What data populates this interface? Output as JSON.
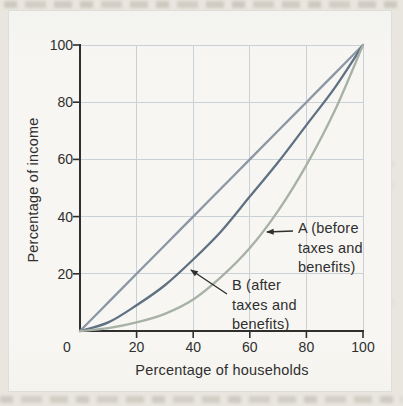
{
  "figure": {
    "y_axis_title": "Percentage of income",
    "x_axis_title": "Percentage of households",
    "label_a": "A (before\ntaxes and\nbenefits)",
    "label_b": "B (after\ntaxes and\nbenefits)"
  },
  "colors": {
    "page_bg": "#e9e6df",
    "figure_bg": "#f7f6f2",
    "grid": "#c9d1d7",
    "axis": "#2f2f2f",
    "text": "#2f2f2f",
    "equality_line": "#8b97a4",
    "curve_b": "#5f7182",
    "curve_a": "#a7b1a5"
  },
  "chart_data": {
    "type": "line",
    "title": "",
    "xlabel": "Percentage of households",
    "ylabel": "Percentage of income",
    "xlim": [
      0,
      100
    ],
    "ylim": [
      0,
      100
    ],
    "x_ticks": [
      0,
      20,
      40,
      60,
      80,
      100
    ],
    "y_ticks": [
      20,
      40,
      60,
      80,
      100
    ],
    "grid": true,
    "legend_position": "annotated-on-plot",
    "x": [
      0,
      10,
      20,
      30,
      40,
      50,
      60,
      70,
      80,
      90,
      100
    ],
    "series": [
      {
        "name": "Line of equality (diagonal)",
        "color": "#8b97a4",
        "values": [
          0,
          10,
          20,
          30,
          40,
          50,
          60,
          70,
          80,
          90,
          100
        ]
      },
      {
        "name": "B (after taxes and benefits)",
        "color": "#5f7182",
        "values": [
          0,
          3,
          9,
          16,
          25,
          35,
          47,
          59,
          72,
          85,
          100
        ]
      },
      {
        "name": "A (before taxes and benefits)",
        "color": "#a7b1a5",
        "values": [
          0,
          1,
          3,
          6,
          11,
          19,
          29,
          42,
          58,
          77,
          100
        ]
      }
    ]
  }
}
